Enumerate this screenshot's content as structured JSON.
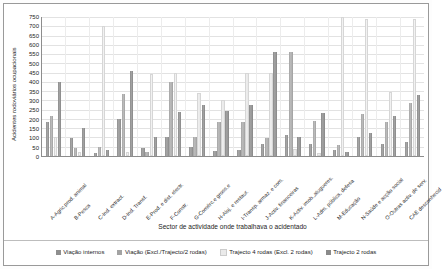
{
  "chart_data": {
    "type": "bar",
    "title": "",
    "xlabel": "Sector de actividade onde trabalhava o acidentado",
    "ylabel": "Acidentes rodoviários ocupacionais",
    "ylim": [
      0,
      750
    ],
    "yticks": [
      0,
      50,
      100,
      150,
      200,
      250,
      300,
      350,
      400,
      450,
      500,
      550,
      600,
      650,
      700,
      750
    ],
    "grid": true,
    "legend_position": "bottom",
    "categories": [
      "A-Agric.prod. animal",
      "B-Pesca",
      "C-Ind. extract.",
      "D-Ind. Transf.",
      "E-Prod. e dist. electr.",
      "F-Constr.",
      "G-Comérc.e gross.e",
      "H-Aloj. e restaur.",
      "I-Transp. armaz. e com.",
      "J-Activ. financeiras",
      "K-Activ. imob.,alugueres.",
      "L-Adm. pública, defesa",
      "M-Educação",
      "N-Saúde e acção social",
      "O-Outras activ. de serv.",
      "CAE desconhecid"
    ],
    "series": [
      {
        "name": "Viação internos",
        "color": "#8e8e8e",
        "values": [
          185,
          95,
          15,
          200,
          45,
          100,
          50,
          25,
          35,
          65,
          115,
          65,
          30,
          100,
          65,
          75
        ]
      },
      {
        "name": "Viação (Excl./Trajecto/2 rodas)",
        "color": "#a3a3a3",
        "values": [
          215,
          45,
          50,
          335,
          20,
          400,
          100,
          185,
          185,
          95,
          560,
          190,
          60,
          225,
          185,
          285
        ]
      },
      {
        "name": "Trajecto 4 rodas (Excl. 2 rodas)",
        "color": "#eaeaea",
        "values": [
          100,
          20,
          700,
          20,
          445,
          450,
          340,
          300,
          450,
          450,
          40,
          15,
          750,
          740,
          345,
          740
        ]
      },
      {
        "name": "Trajecto 2 rodas",
        "color": "#8a8a8a",
        "values": [
          400,
          150,
          30,
          460,
          100,
          235,
          275,
          245,
          275,
          560,
          100,
          230,
          20,
          125,
          215,
          330
        ]
      }
    ]
  },
  "legend": {
    "items": [
      "Viação internos",
      "Viação (Excl./Trajecto/2 rodas)",
      "Trajecto 4 rodas (Excl. 2 rodas)",
      "Trajecto 2 rodas"
    ]
  }
}
